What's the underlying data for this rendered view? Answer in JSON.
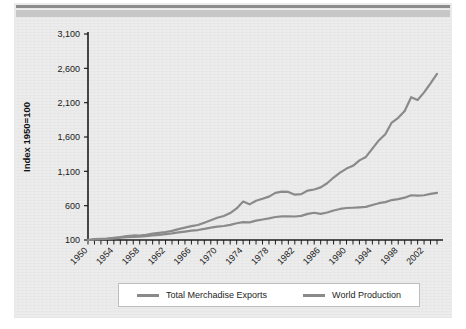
{
  "figure": {
    "background_color": "#ececec",
    "rule_color": "#8b8b8b",
    "band_color": "#c7c7c7"
  },
  "chart_data": {
    "type": "line",
    "title": "",
    "xlabel": "",
    "ylabel": "Index 1950=100",
    "ylim": [
      100,
      3100
    ],
    "yticks": [
      "100",
      "600",
      "1,100",
      "1,600",
      "2,100",
      "2,600",
      "3,100"
    ],
    "ytick_values": [
      100,
      600,
      1100,
      1600,
      2100,
      2600,
      3100
    ],
    "xlim": [
      1950,
      2004
    ],
    "xticks": [
      "1950",
      "1954",
      "1958",
      "1962",
      "1966",
      "1970",
      "1974",
      "1978",
      "1982",
      "1986",
      "1990",
      "1994",
      "1998",
      "2002"
    ],
    "xtick_values": [
      1950,
      1954,
      1958,
      1962,
      1966,
      1970,
      1974,
      1978,
      1982,
      1986,
      1990,
      1994,
      1998,
      2002
    ],
    "grid": false,
    "legend_position": "bottom",
    "x": [
      1950,
      1951,
      1952,
      1953,
      1954,
      1955,
      1956,
      1957,
      1958,
      1959,
      1960,
      1961,
      1962,
      1963,
      1964,
      1965,
      1966,
      1967,
      1968,
      1969,
      1970,
      1971,
      1972,
      1973,
      1974,
      1975,
      1976,
      1977,
      1978,
      1979,
      1980,
      1981,
      1982,
      1983,
      1984,
      1985,
      1986,
      1987,
      1988,
      1989,
      1990,
      1991,
      1992,
      1993,
      1994,
      1995,
      1996,
      1997,
      1998,
      1999,
      2000,
      2001,
      2002,
      2003,
      2004
    ],
    "series": [
      {
        "name": "Total Merchadise Exports",
        "color": "#8a8a8a",
        "values": [
          100,
          112,
          115,
          120,
          131,
          143,
          156,
          166,
          163,
          175,
          193,
          205,
          216,
          233,
          259,
          280,
          303,
          318,
          352,
          388,
          424,
          450,
          492,
          560,
          660,
          619,
          671,
          700,
          732,
          787,
          805,
          800,
          760,
          768,
          820,
          836,
          866,
          926,
          1010,
          1082,
          1140,
          1180,
          1260,
          1310,
          1430,
          1550,
          1640,
          1810,
          1880,
          1980,
          2180,
          2140,
          2250,
          2380,
          2520
        ]
      },
      {
        "name": "World Production",
        "color": "#8a8a8a",
        "values": [
          100,
          107,
          111,
          118,
          124,
          133,
          140,
          146,
          147,
          157,
          168,
          176,
          186,
          196,
          210,
          223,
          236,
          245,
          262,
          281,
          294,
          304,
          321,
          344,
          360,
          357,
          382,
          398,
          415,
          435,
          444,
          446,
          442,
          452,
          481,
          497,
          480,
          500,
          530,
          552,
          566,
          570,
          575,
          582,
          610,
          636,
          652,
          682,
          696,
          716,
          752,
          745,
          752,
          772,
          785
        ]
      }
    ]
  },
  "legend": {
    "items": [
      {
        "label": "Total Merchadise Exports",
        "color": "#8a8a8a"
      },
      {
        "label": "World Production",
        "color": "#8a8a8a"
      }
    ]
  }
}
